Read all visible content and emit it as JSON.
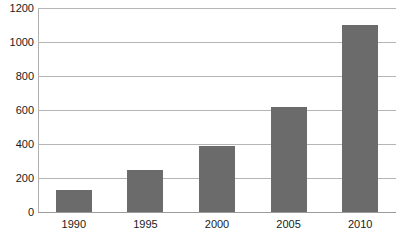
{
  "chart_data": {
    "type": "bar",
    "title": "",
    "subtitle": "",
    "xlabel": "",
    "ylabel": "",
    "categories": [
      "1990",
      "1995",
      "2000",
      "2005",
      "2010"
    ],
    "values": [
      130,
      250,
      390,
      618,
      1100
    ],
    "series": [
      {
        "name": "",
        "values": [
          130,
          250,
          390,
          618,
          1100
        ]
      }
    ],
    "ylim": [
      0,
      1200
    ],
    "y_ticks": [
      0,
      200,
      400,
      600,
      800,
      1000,
      1200
    ],
    "y_tick_labels": [
      "0",
      "200",
      "400",
      "600",
      "800",
      "1000",
      "1200"
    ],
    "x_tick_labels": [
      "1990",
      "1995",
      "2000",
      "2005",
      "2010"
    ],
    "grid": true,
    "grid_axis": "y",
    "legend": false,
    "legend_position": "none",
    "bar_color": "#6b6b6b",
    "gridline_color": "#b5b5b5",
    "axis_color": "#9a9a9a",
    "background_color": "#ffffff",
    "text_color": "#1a1a1a",
    "annotations": []
  }
}
